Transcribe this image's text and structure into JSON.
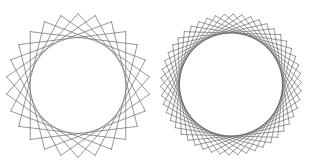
{
  "figures": [
    {
      "id": "left-star-polygon",
      "description": "Star polygon string-art ring, sparser lattice",
      "points": 26,
      "step": 7,
      "line_color": "#6a6a6a"
    },
    {
      "id": "right-star-polygon",
      "description": "Star polygon string-art ring, denser lattice",
      "points": 50,
      "step": 12,
      "line_color": "#555555"
    }
  ],
  "background_color": "#ffffff"
}
